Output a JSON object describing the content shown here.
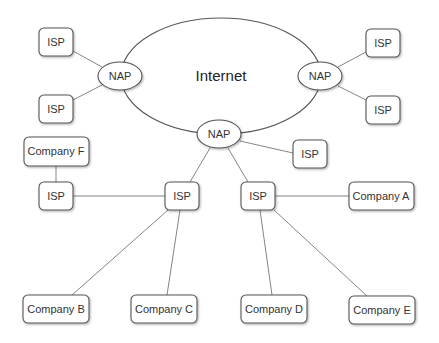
{
  "diagram": {
    "type": "network-topology",
    "cloud": {
      "label": "Internet"
    },
    "naps": [
      {
        "id": "nap-left",
        "label": "NAP"
      },
      {
        "id": "nap-right",
        "label": "NAP"
      },
      {
        "id": "nap-bottom",
        "label": "NAP"
      }
    ],
    "isps": [
      {
        "id": "isp-tl",
        "label": "ISP"
      },
      {
        "id": "isp-ml",
        "label": "ISP"
      },
      {
        "id": "isp-tr",
        "label": "ISP"
      },
      {
        "id": "isp-mr",
        "label": "ISP"
      },
      {
        "id": "isp-b",
        "label": "ISP"
      },
      {
        "id": "isp-f",
        "label": "ISP"
      },
      {
        "id": "isp-c1",
        "label": "ISP"
      },
      {
        "id": "isp-c2",
        "label": "ISP"
      }
    ],
    "companies": [
      {
        "id": "co-f",
        "label": "Company F"
      },
      {
        "id": "co-a",
        "label": "Company A"
      },
      {
        "id": "co-b",
        "label": "Company B"
      },
      {
        "id": "co-c",
        "label": "Company C"
      },
      {
        "id": "co-d",
        "label": "Company D"
      },
      {
        "id": "co-e",
        "label": "Company E"
      }
    ],
    "edges": [
      [
        "isp-tl",
        "nap-left"
      ],
      [
        "isp-ml",
        "nap-left"
      ],
      [
        "isp-tr",
        "nap-right"
      ],
      [
        "isp-mr",
        "nap-right"
      ],
      [
        "isp-b",
        "nap-bottom"
      ],
      [
        "isp-c1",
        "nap-bottom"
      ],
      [
        "isp-c2",
        "nap-bottom"
      ],
      [
        "co-f",
        "isp-f"
      ],
      [
        "isp-f",
        "isp-c1"
      ],
      [
        "isp-c1",
        "co-b"
      ],
      [
        "isp-c1",
        "co-c"
      ],
      [
        "isp-c2",
        "co-a"
      ],
      [
        "isp-c2",
        "co-d"
      ],
      [
        "isp-c2",
        "co-e"
      ]
    ]
  }
}
